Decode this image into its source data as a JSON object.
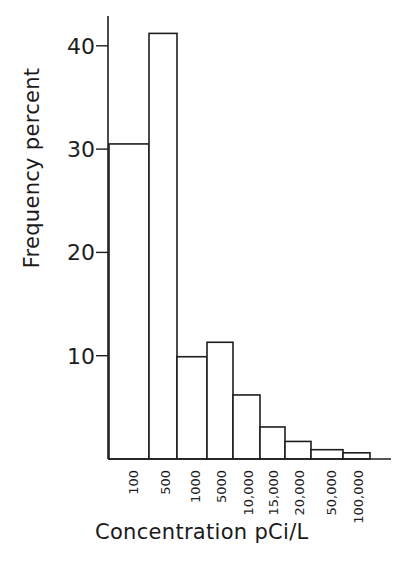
{
  "chart_data": {
    "type": "bar",
    "title": "",
    "xlabel": "Concentration pCi/L",
    "ylabel": "Frequency percent",
    "ylim": [
      0,
      42
    ],
    "yticks": [
      10,
      20,
      30,
      40
    ],
    "grid": false,
    "legend": null,
    "bin_edge_labels": [
      "100",
      "500",
      "1000",
      "5000",
      "10,000",
      "15,000",
      "20,000",
      "50,000",
      "100,000"
    ],
    "categories": [
      "<100",
      "100-500",
      "500-1000",
      "1000-5000",
      "5000-10,000",
      "10,000-15,000",
      "15,000-20,000",
      "20,000-50,000",
      "50,000-100,000"
    ],
    "values": [
      30.5,
      41.2,
      9.9,
      11.3,
      6.2,
      3.1,
      1.7,
      0.9,
      0.6
    ]
  },
  "labels": {
    "x": "Concentration pCi/L",
    "y": "Frequency percent"
  }
}
